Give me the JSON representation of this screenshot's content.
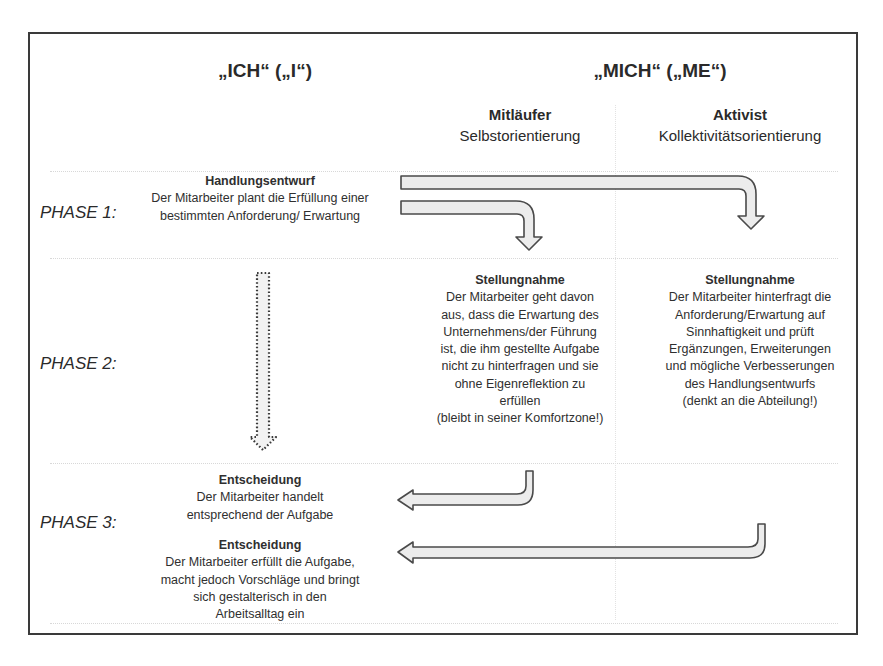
{
  "header": {
    "left_title": "„ICH“ („I“)",
    "right_title": "„MICH“ („ME“)"
  },
  "columns": [
    {
      "title": "Mitläufer",
      "subtitle": "Selbstorientierung"
    },
    {
      "title": "Aktivist",
      "subtitle": "Kollektivitätsorientierung"
    }
  ],
  "phases": [
    {
      "label": "PHASE 1:"
    },
    {
      "label": "PHASE 2:"
    },
    {
      "label": "PHASE 3:"
    }
  ],
  "phase1": {
    "title": "Handlungsentwurf",
    "lines": [
      "Der Mitarbeiter plant die Erfüllung einer",
      "bestimmten Anforderung/ Erwartung"
    ]
  },
  "phase2": {
    "mitlaeufer": {
      "title": "Stellungnahme",
      "lines": [
        "Der Mitarbeiter geht davon",
        "aus, dass die Erwartung des",
        "Unternehmens/der Führung",
        "ist, die ihm gestellte Aufgabe",
        "nicht zu hinterfragen und sie",
        "ohne Eigenreflektion zu",
        "erfüllen",
        "(bleibt in seiner Komfortzone!)"
      ]
    },
    "aktivist": {
      "title": "Stellungnahme",
      "lines": [
        "Der Mitarbeiter hinterfragt die",
        "Anforderung/Erwartung auf",
        "Sinnhaftigkeit und prüft",
        "Ergänzungen, Erweiterungen",
        "und mögliche Verbesserungen",
        "des Handlungsentwurfs",
        "(denkt an die Abteilung!)"
      ]
    }
  },
  "phase3": {
    "decision1": {
      "title": "Entscheidung",
      "lines": [
        "Der Mitarbeiter handelt",
        "entsprechend der Aufgabe"
      ]
    },
    "decision2": {
      "title": "Entscheidung",
      "lines": [
        "Der Mitarbeiter erfüllt die Aufgabe,",
        "macht jedoch Vorschläge und bringt",
        "sich gestalterisch in den",
        "Arbeitsalltag ein"
      ]
    }
  },
  "arrows": [
    {
      "name": "arrow-plan-to-aktivist",
      "style": "solid",
      "direction": "right-then-down"
    },
    {
      "name": "arrow-plan-to-mitlaeufer",
      "style": "solid",
      "direction": "right-then-down"
    },
    {
      "name": "arrow-ich-phase1-to-phase3",
      "style": "dotted",
      "direction": "down"
    },
    {
      "name": "arrow-mitlaeufer-to-decision1",
      "style": "solid",
      "direction": "down-then-left"
    },
    {
      "name": "arrow-aktivist-to-decision2",
      "style": "solid",
      "direction": "down-then-left"
    }
  ],
  "colors": {
    "frame": "#3a3a3a",
    "arrow_fill": "#ececec",
    "arrow_stroke": "#4a4a4a",
    "text": "#2a2a2a"
  }
}
